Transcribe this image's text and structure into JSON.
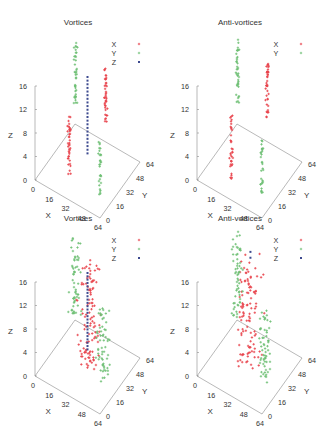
{
  "chart_data": [
    {
      "type": "scatter",
      "subtype": "scatter3d",
      "title": "Vortices",
      "xlabel": "X",
      "ylabel": "Y",
      "zlabel": "Z",
      "xlim": [
        0,
        64
      ],
      "ylim": [
        0,
        64
      ],
      "zlim": [
        0,
        16
      ],
      "xticks": [
        "0",
        "16",
        "32",
        "48",
        "64"
      ],
      "yticks": [
        "0",
        "16",
        "32",
        "48",
        "64"
      ],
      "zticks": [
        "0",
        "4",
        "8",
        "12",
        "16"
      ],
      "legend": "top-right",
      "series": [
        {
          "name": "X",
          "color": "#e8434b",
          "marker": "plus",
          "clusters": [
            {
              "x": 40,
              "y": 48,
              "z": [
                6,
                16
              ],
              "n": 40,
              "spread": 2
            },
            {
              "x": 24,
              "y": 16,
              "z": [
                0,
                11
              ],
              "n": 40,
              "spread": 2
            }
          ]
        },
        {
          "name": "Y",
          "color": "#6dbf73",
          "marker": "plus",
          "clusters": [
            {
              "x": 8,
              "y": 52,
              "z": [
                6,
                17
              ],
              "n": 40,
              "spread": 2
            },
            {
              "x": 54,
              "y": 16,
              "z": [
                0,
                10
              ],
              "n": 30,
              "spread": 2
            }
          ]
        },
        {
          "name": "Z",
          "color": "#3d4a8f",
          "marker": "square",
          "line": {
            "x": 32,
            "y": 32,
            "z": [
              3,
              16
            ],
            "n": 22
          }
        }
      ]
    },
    {
      "type": "scatter",
      "subtype": "scatter3d",
      "title": "Anti-vortices",
      "xlabel": "X",
      "ylabel": "Y",
      "zlabel": "Z",
      "xlim": [
        0,
        64
      ],
      "ylim": [
        0,
        64
      ],
      "zlim": [
        0,
        16
      ],
      "xticks": [
        "0",
        "16",
        "32",
        "48",
        "64"
      ],
      "yticks": [
        "0",
        "16",
        "32",
        "48",
        "64"
      ],
      "zticks": [
        "0",
        "4",
        "8",
        "12",
        "16"
      ],
      "legend": "top-right",
      "series": [
        {
          "name": "X",
          "color": "#e8434b",
          "marker": "plus",
          "clusters": [
            {
              "x": 40,
              "y": 48,
              "z": [
                6,
                17
              ],
              "n": 40,
              "spread": 2
            },
            {
              "x": 24,
              "y": 16,
              "z": [
                0,
                11
              ],
              "n": 35,
              "spread": 2
            }
          ]
        },
        {
          "name": "Y",
          "color": "#6dbf73",
          "marker": "plus",
          "clusters": [
            {
              "x": 8,
              "y": 52,
              "z": [
                6,
                17
              ],
              "n": 40,
              "spread": 2
            },
            {
              "x": 54,
              "y": 16,
              "z": [
                0,
                10
              ],
              "n": 30,
              "spread": 2
            }
          ]
        }
      ]
    },
    {
      "type": "scatter",
      "subtype": "scatter3d",
      "title": "Vortices",
      "xlabel": "X",
      "ylabel": "Y",
      "zlabel": "Z",
      "xlim": [
        0,
        64
      ],
      "ylim": [
        0,
        64
      ],
      "zlim": [
        0,
        16
      ],
      "xticks": [
        "0",
        "16",
        "32",
        "48",
        "64"
      ],
      "yticks": [
        "0",
        "16",
        "32",
        "48",
        "64"
      ],
      "zticks": [
        "0",
        "4",
        "8",
        "12",
        "16"
      ],
      "legend": "top-right",
      "series": [
        {
          "name": "X",
          "color": "#e8434b",
          "marker": "plus",
          "clusters": [
            {
              "x": 32,
              "y": 32,
              "z": [
                0,
                18
              ],
              "n": 110,
              "spread": 14
            }
          ]
        },
        {
          "name": "Y",
          "color": "#6dbf73",
          "marker": "plus",
          "clusters": [
            {
              "x": 10,
              "y": 48,
              "z": [
                4,
                18
              ],
              "n": 60,
              "spread": 8
            },
            {
              "x": 54,
              "y": 20,
              "z": [
                2,
                14
              ],
              "n": 60,
              "spread": 8
            }
          ]
        },
        {
          "name": "Z",
          "color": "#3d4a8f",
          "marker": "square",
          "line": {
            "x": 32,
            "y": 32,
            "z": [
              3,
              16
            ],
            "n": 24
          }
        }
      ]
    },
    {
      "type": "scatter",
      "subtype": "scatter3d",
      "title": "Anti-vortices",
      "xlabel": "X",
      "ylabel": "Y",
      "zlabel": "Z",
      "xlim": [
        0,
        64
      ],
      "ylim": [
        0,
        64
      ],
      "zlim": [
        0,
        16
      ],
      "xticks": [
        "0",
        "16",
        "32",
        "48",
        "64"
      ],
      "yticks": [
        "0",
        "16",
        "32",
        "48",
        "64"
      ],
      "zticks": [
        "0",
        "4",
        "8",
        "12",
        "16"
      ],
      "legend": "top-right",
      "series": [
        {
          "name": "X",
          "color": "#e8434b",
          "marker": "plus",
          "clusters": [
            {
              "x": 32,
              "y": 32,
              "z": [
                0,
                18
              ],
              "n": 110,
              "spread": 14
            }
          ]
        },
        {
          "name": "Y",
          "color": "#6dbf73",
          "marker": "plus",
          "clusters": [
            {
              "x": 10,
              "y": 48,
              "z": [
                3,
                18
              ],
              "n": 60,
              "spread": 8
            },
            {
              "x": 54,
              "y": 20,
              "z": [
                2,
                14
              ],
              "n": 60,
              "spread": 8
            }
          ]
        },
        {
          "name": "Z",
          "color": "#3d4a8f",
          "marker": "square",
          "points": [
            {
              "x": 28,
              "y": 40,
              "z": 18
            },
            {
              "x": 28,
              "y": 40,
              "z": 17
            }
          ]
        }
      ]
    }
  ]
}
